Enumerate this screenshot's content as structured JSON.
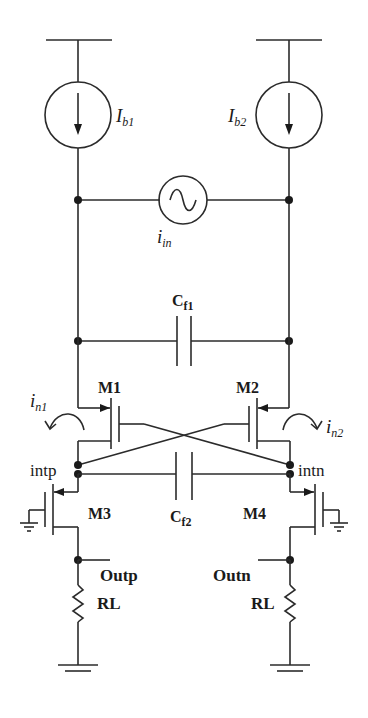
{
  "diagram": {
    "type": "circuit-schematic",
    "current_sources": [
      {
        "id": "Ib1",
        "symbol": "I",
        "subscript": "b1"
      },
      {
        "id": "Ib2",
        "symbol": "I",
        "subscript": "b2"
      }
    ],
    "ac_source": {
      "id": "iin",
      "symbol": "i",
      "subscript": "in"
    },
    "capacitors": [
      {
        "id": "Cf1",
        "symbol": "C",
        "subscript": "f1"
      },
      {
        "id": "Cf2",
        "symbol": "C",
        "subscript": "f2"
      }
    ],
    "transistors": [
      {
        "id": "M1",
        "label": "M1"
      },
      {
        "id": "M2",
        "label": "M2"
      },
      {
        "id": "M3",
        "label": "M3"
      },
      {
        "id": "M4",
        "label": "M4"
      }
    ],
    "noise_currents": [
      {
        "id": "in1",
        "symbol": "i",
        "subscript": "n1"
      },
      {
        "id": "in2",
        "symbol": "i",
        "subscript": "n2"
      }
    ],
    "nodes": {
      "intp": "intp",
      "intn": "intn",
      "outp": "Outp",
      "outn": "Outn"
    },
    "resistors": [
      {
        "id": "RL_left",
        "label": "RL"
      },
      {
        "id": "RL_right",
        "label": "RL"
      }
    ]
  }
}
